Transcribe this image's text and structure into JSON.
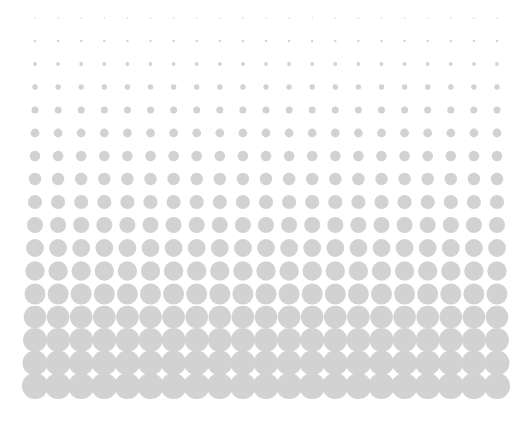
{
  "canvas": {
    "width": 530,
    "height": 432,
    "background_color": "#ffffff",
    "title": "Halftone Dot Gradient"
  },
  "graphic": {
    "name": "halftone-dot-gradient",
    "type": "halftone",
    "description": "Grid of uniform light-gray circles whose radius increases smoothly from top to bottom, producing a density gradient. Bottom rows overlap leaving small white diamond-shaped gaps.",
    "dot_color": "#d2d2d2",
    "dot_shape": "circle",
    "grid": {
      "columns": 21,
      "rows": 17,
      "origin_x": 35,
      "origin_y": 18,
      "spacing_x": 23.1,
      "spacing_y": 23.0
    },
    "radius_progression": {
      "unit": "px",
      "min_radius": 0.7,
      "max_radius": 13.1,
      "by_row": [
        0.7,
        1.2,
        1.9,
        2.7,
        3.5,
        4.4,
        5.3,
        6.2,
        7.1,
        8.0,
        8.9,
        9.7,
        10.5,
        11.3,
        11.9,
        12.5,
        13.1
      ]
    }
  },
  "chart_data": {
    "type": "scatter",
    "xlabel": "",
    "ylabel": "",
    "grid": false,
    "legend": "none",
    "xlim": [
      0,
      530
    ],
    "ylim": [
      432,
      0
    ],
    "series": [
      {
        "name": "dot-radius-by-row",
        "x": [
          1,
          2,
          3,
          4,
          5,
          6,
          7,
          8,
          9,
          10,
          11,
          12,
          13,
          14,
          15,
          16,
          17
        ],
        "values": [
          0.7,
          1.2,
          1.9,
          2.7,
          3.5,
          4.4,
          5.3,
          6.2,
          7.1,
          8.0,
          8.9,
          9.7,
          10.5,
          11.3,
          11.9,
          12.5,
          13.1
        ],
        "color": "#d2d2d2"
      }
    ]
  }
}
